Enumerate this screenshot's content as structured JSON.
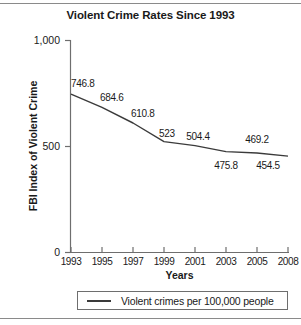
{
  "figure": {
    "top_rule": true,
    "bottom_rule": true
  },
  "chart_data": {
    "type": "line",
    "title": "Violent Crime Rates Since 1993",
    "xlabel": "Years",
    "ylabel": "FBI Index of Violent Crime",
    "categories": [
      "1993",
      "1995",
      "1997",
      "1999",
      "2001",
      "2003",
      "2005",
      "2008"
    ],
    "x": [
      1993,
      1995,
      1997,
      1999,
      2001,
      2003,
      2005,
      2008
    ],
    "values": [
      746.8,
      684.6,
      610.8,
      523,
      504.4,
      475.8,
      469.2,
      454.5
    ],
    "point_labels": [
      "746.8",
      "684.6",
      "610.8",
      "523",
      "504.4",
      "475.8",
      "469.2",
      "454.5"
    ],
    "point_label_positions": [
      "above",
      "above",
      "above",
      "above",
      "above",
      "below",
      "above",
      "below"
    ],
    "ylim": [
      0,
      1000
    ],
    "yticks": [
      0,
      500,
      1000
    ],
    "ytick_labels": [
      "0",
      "500",
      "1,000"
    ],
    "grid": false,
    "legend_position": "below-axes",
    "series": [
      {
        "name": "Violent crimes per 100,000 people",
        "color": "#3b3b3b",
        "values": [
          746.8,
          684.6,
          610.8,
          523,
          504.4,
          475.8,
          469.2,
          454.5
        ]
      }
    ],
    "legend": [
      {
        "label": "Violent crimes per 100,000 people",
        "color": "#3b3b3b"
      }
    ]
  },
  "colors": {
    "line": "#3b3b3b",
    "axis": "#6e6e6e",
    "text": "#1a1a1a",
    "rule": "#8a8a8a"
  }
}
